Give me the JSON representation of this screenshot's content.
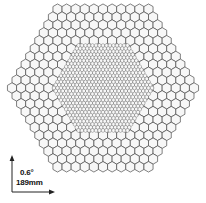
{
  "figure": {
    "name": "hexagonal-detector-array-diagram",
    "background_color": "#ffffff",
    "outline_color": "#3a3a3a",
    "cell_fill_color": "#f7f7f7",
    "cell_stroke_color": "#4a4a4a"
  },
  "array": {
    "overall_shape": "hexagon",
    "orientation": "flat-top",
    "center_x": 103,
    "center_y": 88,
    "outer_radius_px": 95,
    "coarse_region": {
      "name": "outer-coarse-pixel-region",
      "cell_pitch_px": 9.1,
      "cell_stroke_width": 0.7
    },
    "fine_region": {
      "name": "inner-fine-pixel-region",
      "shape": "hexagon",
      "radius_px": 52,
      "cell_pitch_px": 3.5,
      "cell_stroke_width": 0.35
    }
  },
  "scale_indicator": {
    "name": "scale-indicator",
    "angular_scale": "0.6°",
    "linear_scale": "189mm",
    "axis_color": "#222222",
    "origin_x": 12,
    "origin_y": 192,
    "vertical_length_px": 34,
    "horizontal_length_px": 40
  },
  "chart_data": {
    "type": "diagram",
    "title": "",
    "annotations": [
      "0.6°",
      "189mm"
    ],
    "elements": [
      {
        "label": "outer coarse hexagonal pixel ring",
        "pitch_px": 9.1
      },
      {
        "label": "inner fine hexagonal pixel region",
        "pitch_px": 3.5
      }
    ]
  }
}
